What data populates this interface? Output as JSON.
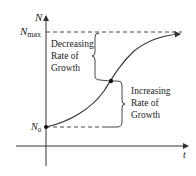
{
  "diagram": {
    "type": "logistic-growth-curve",
    "axes": {
      "y_label": "N",
      "x_label": "t"
    },
    "levels": {
      "max_label_base": "N",
      "max_label_sub": "max",
      "initial_label_base": "N",
      "initial_label_sub": "0"
    },
    "annotations": {
      "upper": [
        "Decreasing",
        "Rate of",
        "Growth"
      ],
      "lower": [
        "Increasing",
        "Rate of",
        "Growth"
      ]
    },
    "colors": {
      "line": "#333333",
      "text": "#222222"
    }
  }
}
